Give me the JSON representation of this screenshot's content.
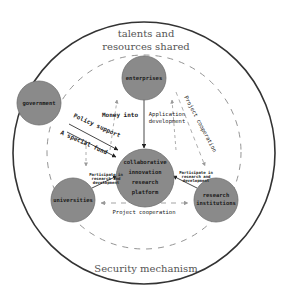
{
  "diagram": {
    "outer_label_top": [
      "talents and",
      "resources shared"
    ],
    "outer_label_bottom": "Security mechanism",
    "nodes": {
      "enterprises": "enterprises",
      "government": "government",
      "platform": [
        "collaborative",
        "innovation",
        "research",
        "platform"
      ],
      "universities": "universities",
      "research_institutions": [
        "research",
        "institutions"
      ]
    },
    "edges": {
      "money_into": "Money into",
      "application_development": [
        "Application",
        "development"
      ],
      "policy_support": "Policy support",
      "special_fund": "A special fund",
      "project_cooperation_diag": "Project cooperation",
      "project_cooperation_bottom": "Project cooperation",
      "participate_left": [
        "Participate in",
        "research and",
        "development"
      ],
      "participate_right": [
        "Participate in",
        "research and",
        "development"
      ]
    },
    "colors": {
      "node_fill": "#8a8a8a",
      "node_stroke": "#6e6e6e",
      "outer_circle": "#333333",
      "dashed_circle": "#888888",
      "arrow": "#333333",
      "dashed_arrow": "#999999"
    }
  }
}
